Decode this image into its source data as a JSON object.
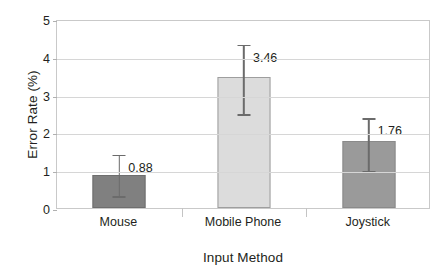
{
  "chart_data": {
    "type": "bar",
    "title": "",
    "xlabel": "Input Method",
    "ylabel": "Error Rate (%)",
    "categories": [
      "Mouse",
      "Mobile Phone",
      "Joystick"
    ],
    "values": [
      0.88,
      3.46,
      1.76
    ],
    "value_labels": [
      "0.88",
      "3.46",
      "1.76"
    ],
    "error_bars": [
      {
        "lower": 0.32,
        "upper": 1.46
      },
      {
        "lower": 2.49,
        "upper": 4.37
      },
      {
        "lower": 0.98,
        "upper": 2.43
      }
    ],
    "ylim": [
      0,
      5
    ],
    "yticks": [
      0,
      1,
      2,
      3,
      4,
      5
    ],
    "ytick_labels": [
      "0",
      "1",
      "2",
      "3",
      "4",
      "5"
    ],
    "grid": true,
    "legend": null,
    "bar_colors": [
      "#808080",
      "#DCDCDC",
      "#9A9A9A"
    ],
    "bar_border_colors": [
      "#6E6E6E",
      "#9E9E9E",
      "#8A8A8A"
    ],
    "errorbar_color": "#6B6B6B",
    "gridline_color": "#D6D6D6",
    "axis_color": "#C9C9C9",
    "text_color": "#231F20"
  }
}
